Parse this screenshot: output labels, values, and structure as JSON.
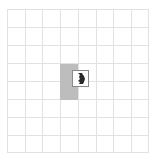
{
  "board": {
    "columns": 8,
    "rows": 8,
    "grid_color": "#e2e2e2",
    "background": "#ffffff"
  },
  "shadow_block": {
    "color": "#bdbdbd",
    "col": 3,
    "row": 3,
    "width_cells": 1,
    "height_cells": 2
  },
  "piece": {
    "icon": "rhino-icon",
    "border_color": "#8a8a8a",
    "glyph_color": "#2a2a2a"
  }
}
